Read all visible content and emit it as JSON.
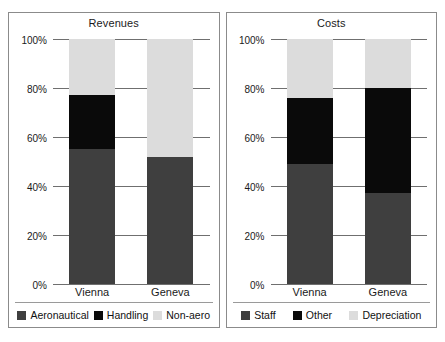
{
  "chart_data": [
    {
      "type": "bar",
      "subtype": "stacked-100-percent",
      "title": "Revenues",
      "xlabel": "",
      "ylabel": "",
      "categories": [
        "Vienna",
        "Geneva"
      ],
      "ylim": [
        0,
        100
      ],
      "ytick_labels": [
        "0%",
        "20%",
        "40%",
        "60%",
        "80%",
        "100%"
      ],
      "ytick_values": [
        0,
        20,
        40,
        60,
        80,
        100
      ],
      "grid": true,
      "legend_position": "bottom",
      "series": [
        {
          "name": "Aeronautical",
          "color": "#3f3f3f",
          "values": [
            55,
            52
          ]
        },
        {
          "name": "Handling",
          "color": "#0a0a0a",
          "values": [
            22,
            0
          ]
        },
        {
          "name": "Non-aero",
          "color": "#dcdcdc",
          "values": [
            23,
            48
          ]
        }
      ]
    },
    {
      "type": "bar",
      "subtype": "stacked-100-percent",
      "title": "Costs",
      "xlabel": "",
      "ylabel": "",
      "categories": [
        "Vienna",
        "Geneva"
      ],
      "ylim": [
        0,
        100
      ],
      "ytick_labels": [
        "0%",
        "20%",
        "40%",
        "60%",
        "80%",
        "100%"
      ],
      "ytick_values": [
        0,
        20,
        40,
        60,
        80,
        100
      ],
      "grid": true,
      "legend_position": "bottom",
      "series": [
        {
          "name": "Staff",
          "color": "#3f3f3f",
          "values": [
            49,
            37
          ]
        },
        {
          "name": "Other",
          "color": "#0a0a0a",
          "values": [
            27,
            43
          ]
        },
        {
          "name": "Depreciation",
          "color": "#dcdcdc",
          "values": [
            24,
            20
          ]
        }
      ]
    }
  ],
  "panels": [
    {
      "title": "Revenues",
      "axis_labels": [
        "100%",
        "80%",
        "60%",
        "40%",
        "20%",
        "0%"
      ],
      "categories": [
        "Vienna",
        "Geneva"
      ],
      "legend": [
        {
          "label": "Aeronautical",
          "color": "#3f3f3f"
        },
        {
          "label": "Handling",
          "color": "#0a0a0a"
        },
        {
          "label": "Non-aero",
          "color": "#dcdcdc"
        }
      ]
    },
    {
      "title": "Costs",
      "axis_labels": [
        "100%",
        "80%",
        "60%",
        "40%",
        "20%",
        "0%"
      ],
      "categories": [
        "Vienna",
        "Geneva"
      ],
      "legend": [
        {
          "label": "Staff",
          "color": "#3f3f3f"
        },
        {
          "label": "Other",
          "color": "#0a0a0a"
        },
        {
          "label": "Depreciation",
          "color": "#dcdcdc"
        }
      ]
    }
  ]
}
